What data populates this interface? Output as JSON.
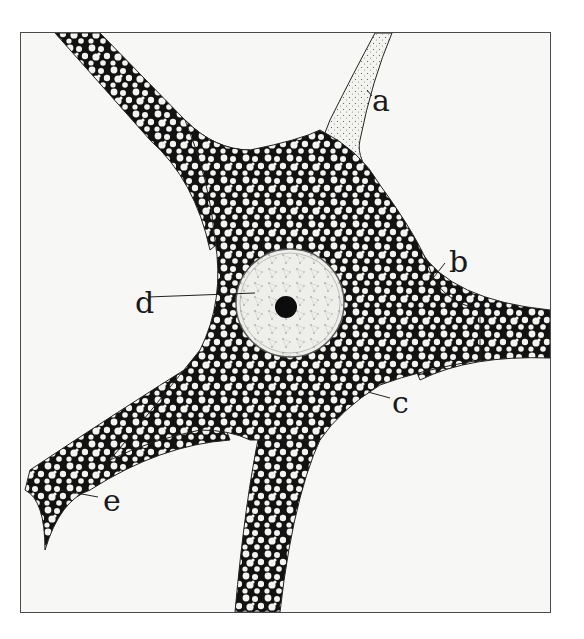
{
  "figure": {
    "colors": {
      "background": "#f7f7f5",
      "ink": "#111111",
      "frame": "#4a4a4a",
      "nucleus_fill": "#eeeeea"
    },
    "labels": [
      {
        "id": "a",
        "text": "a",
        "x": 372,
        "y": 86
      },
      {
        "id": "b",
        "text": "b",
        "x": 449,
        "y": 247
      },
      {
        "id": "c",
        "text": "c",
        "x": 392,
        "y": 388
      },
      {
        "id": "d",
        "text": "d",
        "x": 135,
        "y": 288
      },
      {
        "id": "e",
        "text": "e",
        "x": 103,
        "y": 486
      }
    ]
  }
}
